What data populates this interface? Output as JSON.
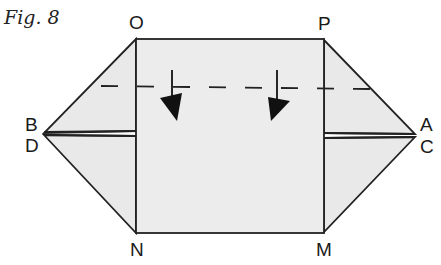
{
  "figure": {
    "title": "Fig. 8"
  },
  "labels": {
    "O": "O",
    "P": "P",
    "B": "B",
    "D": "D",
    "A": "A",
    "C": "C",
    "N": "N",
    "M": "M"
  },
  "colors": {
    "paper_fill": "#ebebeb",
    "line": "#222222",
    "arrow": "#111111"
  }
}
